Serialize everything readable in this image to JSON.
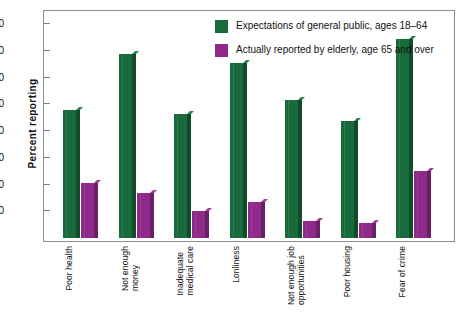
{
  "chart_data": {
    "type": "bar",
    "title": "",
    "xlabel": "",
    "ylabel": "Percent  reporting",
    "ylim": [
      0,
      85
    ],
    "yticks": [
      10,
      20,
      30,
      40,
      50,
      60,
      70,
      80
    ],
    "grid": false,
    "legend_position": "top-right",
    "categories": [
      "Poor health",
      "Not enough\nmoney",
      "Inadequate\nmedical care",
      "Lonliness",
      "Not enough job\nopportunities",
      "Poor housing",
      "Fear of crime"
    ],
    "series": [
      {
        "name": "Expectations of general public, ages 18–64",
        "color": "#1a6b3c",
        "values": [
          48,
          69,
          46.5,
          65.5,
          51.5,
          44,
          74.5
        ]
      },
      {
        "name": "Actually reported by elderly, age 65 and over",
        "color": "#8f2a8a",
        "values": [
          20.5,
          17,
          10,
          13.5,
          6.5,
          5.5,
          25
        ]
      }
    ]
  },
  "axis": {
    "y_title": "Percent  reporting"
  },
  "legend": {
    "items": [
      {
        "label": "Expectations of general public, ages 18–64",
        "swatch": "green"
      },
      {
        "label": "Actually reported by elderly, age 65 and over",
        "swatch": "purple"
      }
    ]
  },
  "colors": {
    "green": "#1a6b3c",
    "purple": "#8f2a8a",
    "frame": "#8e8e8e",
    "background": "#ffffff"
  }
}
